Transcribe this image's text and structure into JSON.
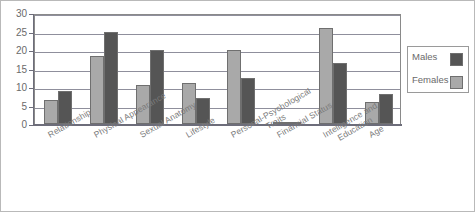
{
  "chart_data": {
    "type": "bar",
    "title": "",
    "subtitle": "",
    "xlabel": "",
    "ylabel": "",
    "ylim": [
      0,
      30
    ],
    "ytick_step": 5,
    "yticks": [
      "30",
      "25",
      "20",
      "15",
      "10",
      "5",
      "0"
    ],
    "grid": true,
    "legend_position": "right",
    "categories": [
      "Relationship",
      "Physical Appearance",
      "Sexual Anatomy",
      "Lifestyle",
      "Personal-Psychological Traits",
      "Financial Status",
      "Intelligence and Education",
      "Age"
    ],
    "category_labels_wrapped": [
      "Relationship",
      "Physical Appearance",
      "Sexual Anatomy",
      "Lifestyle",
      "Personal-Psychological\nTraits",
      "Financial Status",
      "Intelligence and\nEducation",
      "Age"
    ],
    "series": [
      {
        "name": "Females",
        "color": "#a9a9a9",
        "values": [
          6.5,
          18.5,
          10.5,
          11,
          20,
          0.3,
          26,
          6
        ]
      },
      {
        "name": "Males",
        "color": "#555555",
        "values": [
          9,
          25,
          20,
          7,
          12.5,
          0.3,
          16.5,
          8
        ]
      }
    ]
  },
  "legend": {
    "entries": [
      {
        "label": "Males",
        "color": "#555555"
      },
      {
        "label": "Females",
        "color": "#a9a9a9"
      }
    ]
  },
  "colors": {
    "females_bar": "#a9a9a9",
    "males_bar": "#555555",
    "gridline": "#8f8f9c",
    "axis": "#6d6d7a",
    "tick_text": "#6a6a6a",
    "label_text": "#7a7a7a",
    "frame": "#b9b9b9",
    "background": "#ffffff"
  }
}
